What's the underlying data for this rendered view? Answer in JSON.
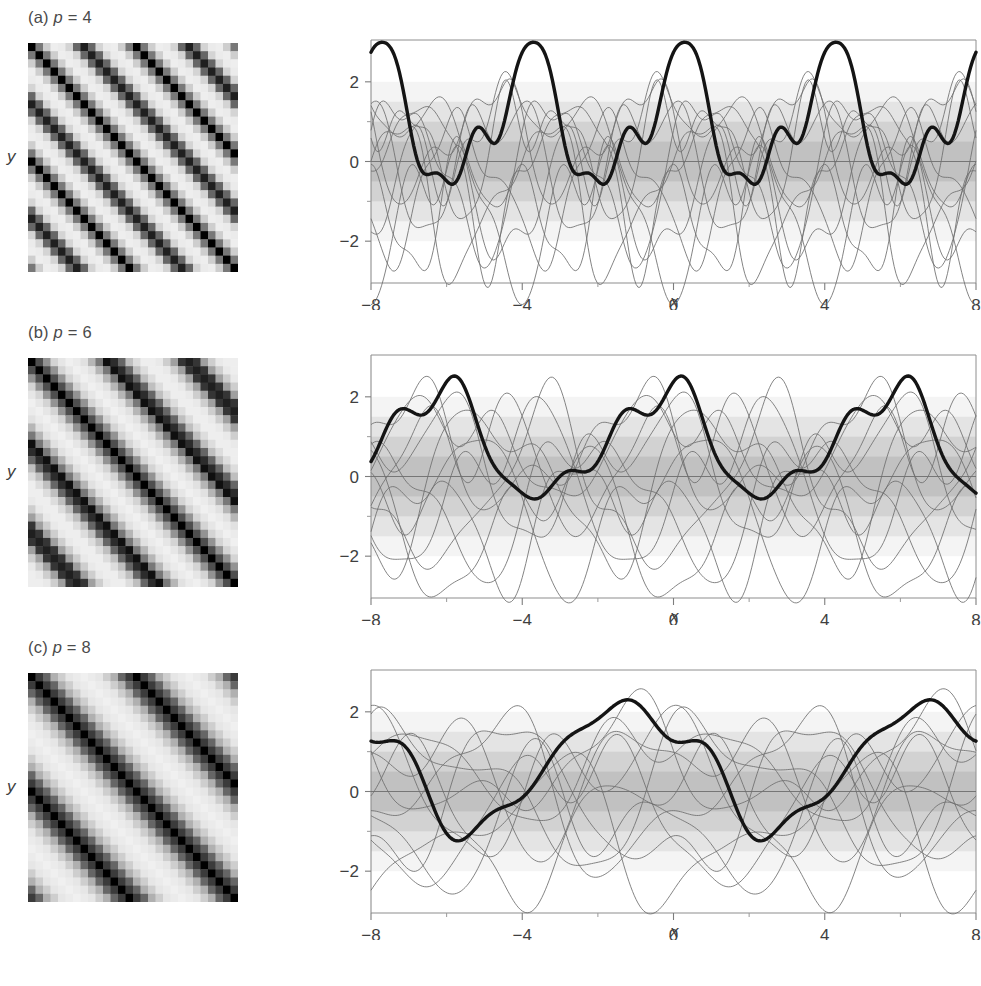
{
  "figure": {
    "background": "#ffffff",
    "ink_color": "#3f3f3f",
    "bold_curve_color": "#1a1a1a",
    "thin_curve_color": "#7a7a7a",
    "band_color": "#b9b9b9"
  },
  "panels": [
    {
      "id": "a",
      "label_prefix": "(a)",
      "label_param": "p",
      "label_eq": "=",
      "label_value": "4",
      "label_full": "(a) p = 4",
      "period": 4,
      "heatmap": {
        "type": "heatmap",
        "kernel": "periodic",
        "period": 4,
        "grid": 28,
        "x_range": [
          -8,
          8
        ],
        "y_range": [
          -8,
          8
        ],
        "lengthscale": 1.0,
        "colormap": "gray-inverted",
        "cell_px": 7.5
      },
      "chart": {
        "type": "line",
        "xlabel": "x",
        "ylabel": "y",
        "xlim": [
          -8,
          8
        ],
        "ylim": [
          -3.05,
          3.05
        ],
        "xticks": [
          -8,
          -4,
          0,
          4,
          8
        ],
        "xticklabels": [
          "−8",
          "−4",
          "0",
          "4",
          "8"
        ],
        "xminorticks": [
          -6,
          -2,
          2,
          6
        ],
        "yticks": [
          -2,
          0,
          2
        ],
        "yticklabels": [
          "−2",
          "0",
          "2"
        ],
        "yminorticks": [
          -1,
          1
        ],
        "grid": false,
        "legend": "none",
        "bands": [
          {
            "level": 0.5,
            "opacity": 0.3
          },
          {
            "level": 1.0,
            "opacity": 0.24
          },
          {
            "level": 1.5,
            "opacity": 0.18
          },
          {
            "level": 2.0,
            "opacity": 0.11
          }
        ],
        "zero_line": 0,
        "bold_series": {
          "name": "highlighted-sample",
          "period": 4,
          "amplitude": 1.55,
          "phase": 1.35,
          "harmonic_amp": 0.62,
          "harmonic_phase": 0.2,
          "offset": 0.95
        },
        "thin_series_count": 11,
        "thin_series": [
          {
            "period": 4,
            "amplitude": 1.85,
            "phase": 0.2,
            "h2": 0.55,
            "p2": 1.1,
            "offset": -0.25
          },
          {
            "period": 4,
            "amplitude": 1.4,
            "phase": 2.4,
            "h2": 0.75,
            "p2": 0.3,
            "offset": 0.1
          },
          {
            "period": 4,
            "amplitude": 1.6,
            "phase": 4.1,
            "h2": 0.45,
            "p2": 2.2,
            "offset": -0.6
          },
          {
            "period": 4,
            "amplitude": 1.1,
            "phase": 1.05,
            "h2": 0.85,
            "p2": 3.4,
            "offset": 0.35
          },
          {
            "period": 4,
            "amplitude": 1.95,
            "phase": 5.3,
            "h2": 0.3,
            "p2": 1.8,
            "offset": -0.45
          },
          {
            "period": 4,
            "amplitude": 0.95,
            "phase": 3.15,
            "h2": 0.95,
            "p2": 0.9,
            "offset": -1.05
          },
          {
            "period": 4,
            "amplitude": 1.7,
            "phase": 0.85,
            "h2": 0.65,
            "p2": 4.6,
            "offset": -0.8
          },
          {
            "period": 4,
            "amplitude": 1.25,
            "phase": 2.95,
            "h2": 0.5,
            "p2": 2.7,
            "offset": 0.55
          },
          {
            "period": 4,
            "amplitude": 1.5,
            "phase": 4.75,
            "h2": 0.7,
            "p2": 5.1,
            "offset": -1.3
          },
          {
            "period": 4,
            "amplitude": 1.05,
            "phase": 1.85,
            "h2": 0.4,
            "p2": 3.9,
            "offset": 0.7
          },
          {
            "period": 4,
            "amplitude": 1.8,
            "phase": 5.95,
            "h2": 0.6,
            "p2": 1.5,
            "offset": -0.15
          }
        ]
      }
    },
    {
      "id": "b",
      "label_prefix": "(b)",
      "label_param": "p",
      "label_eq": "=",
      "label_value": "6",
      "label_full": "(b) p = 6",
      "period": 6,
      "heatmap": {
        "type": "heatmap",
        "kernel": "periodic",
        "period": 6,
        "grid": 28,
        "x_range": [
          -8,
          8
        ],
        "y_range": [
          -8,
          8
        ],
        "lengthscale": 1.0,
        "colormap": "gray-inverted",
        "cell_px": 7.5
      },
      "chart": {
        "type": "line",
        "xlabel": "x",
        "ylabel": "y",
        "xlim": [
          -8,
          8
        ],
        "ylim": [
          -3.05,
          3.05
        ],
        "xticks": [
          -8,
          -4,
          0,
          4,
          8
        ],
        "xticklabels": [
          "−8",
          "−4",
          "0",
          "4",
          "8"
        ],
        "xminorticks": [
          -6,
          -2,
          2,
          6
        ],
        "yticks": [
          -2,
          0,
          2
        ],
        "yticklabels": [
          "−2",
          "0",
          "2"
        ],
        "yminorticks": [
          -1,
          1
        ],
        "grid": false,
        "legend": "none",
        "bands": [
          {
            "level": 0.5,
            "opacity": 0.3
          },
          {
            "level": 1.0,
            "opacity": 0.24
          },
          {
            "level": 1.5,
            "opacity": 0.18
          },
          {
            "level": 2.0,
            "opacity": 0.11
          }
        ],
        "zero_line": 0,
        "bold_series": {
          "name": "highlighted-sample",
          "period": 6,
          "amplitude": 1.3,
          "phase": 1.95,
          "harmonic_amp": 0.3,
          "harmonic_phase": 1.0,
          "offset": 0.8
        },
        "thin_series_count": 11,
        "thin_series": [
          {
            "period": 6,
            "amplitude": 1.75,
            "phase": 0.35,
            "h2": 0.7,
            "p2": 1.4,
            "offset": -0.1
          },
          {
            "period": 6,
            "amplitude": 1.3,
            "phase": 2.1,
            "h2": 0.9,
            "p2": 0.6,
            "offset": 0.25
          },
          {
            "period": 6,
            "amplitude": 1.55,
            "phase": 3.85,
            "h2": 0.55,
            "p2": 2.5,
            "offset": -0.55
          },
          {
            "period": 6,
            "amplitude": 1.05,
            "phase": 0.95,
            "h2": 1.0,
            "p2": 3.7,
            "offset": 0.4
          },
          {
            "period": 6,
            "amplitude": 1.9,
            "phase": 5.1,
            "h2": 0.4,
            "p2": 2.0,
            "offset": -0.35
          },
          {
            "period": 6,
            "amplitude": 0.9,
            "phase": 3.4,
            "h2": 1.05,
            "p2": 1.2,
            "offset": -0.95
          },
          {
            "period": 6,
            "amplitude": 1.65,
            "phase": 1.15,
            "h2": 0.75,
            "p2": 4.9,
            "offset": -0.7
          },
          {
            "period": 6,
            "amplitude": 1.2,
            "phase": 2.75,
            "h2": 0.6,
            "p2": 3.0,
            "offset": 0.6
          },
          {
            "period": 6,
            "amplitude": 1.45,
            "phase": 4.55,
            "h2": 0.8,
            "p2": 5.4,
            "offset": -1.15
          },
          {
            "period": 6,
            "amplitude": 1.0,
            "phase": 1.65,
            "h2": 0.5,
            "p2": 4.2,
            "offset": 0.75
          },
          {
            "period": 6,
            "amplitude": 1.7,
            "phase": 5.75,
            "h2": 0.7,
            "p2": 1.7,
            "offset": -0.2
          }
        ]
      }
    },
    {
      "id": "c",
      "label_prefix": "(c)",
      "label_param": "p",
      "label_eq": "=",
      "label_value": "8",
      "label_full": "(c) p = 8",
      "period": 8,
      "heatmap": {
        "type": "heatmap",
        "kernel": "periodic",
        "period": 8,
        "grid": 28,
        "x_range": [
          -8,
          8
        ],
        "y_range": [
          -8,
          8
        ],
        "lengthscale": 1.0,
        "colormap": "gray-inverted",
        "cell_px": 7.5
      },
      "chart": {
        "type": "line",
        "xlabel": "x",
        "ylabel": "y",
        "xlim": [
          -8,
          8
        ],
        "ylim": [
          -3.05,
          3.05
        ],
        "xticks": [
          -8,
          -4,
          0,
          4,
          8
        ],
        "xticklabels": [
          "−8",
          "−4",
          "0",
          "4",
          "8"
        ],
        "xminorticks": [
          -6,
          -2,
          2,
          6
        ],
        "yticks": [
          -2,
          0,
          2
        ],
        "yticklabels": [
          "−2",
          "0",
          "2"
        ],
        "yminorticks": [
          -1,
          1
        ],
        "grid": false,
        "legend": "none",
        "bands": [
          {
            "level": 0.5,
            "opacity": 0.3
          },
          {
            "level": 1.0,
            "opacity": 0.24
          },
          {
            "level": 1.5,
            "opacity": 0.18
          },
          {
            "level": 2.0,
            "opacity": 0.11
          }
        ],
        "zero_line": 0,
        "bold_series": {
          "name": "highlighted-sample",
          "period": 8,
          "amplitude": 1.52,
          "phase": 2.55,
          "harmonic_amp": 0.18,
          "harmonic_phase": 0.5,
          "offset": 0.7
        },
        "thin_series_count": 11,
        "thin_series": [
          {
            "period": 8,
            "amplitude": 1.55,
            "phase": 0.5,
            "h2": 0.8,
            "p2": 1.6,
            "offset": 0.05
          },
          {
            "period": 8,
            "amplitude": 1.2,
            "phase": 2.3,
            "h2": 1.0,
            "p2": 0.8,
            "offset": 0.3
          },
          {
            "period": 8,
            "amplitude": 1.45,
            "phase": 3.6,
            "h2": 0.65,
            "p2": 2.8,
            "offset": -0.45
          },
          {
            "period": 8,
            "amplitude": 1.0,
            "phase": 1.2,
            "h2": 1.1,
            "p2": 3.9,
            "offset": 0.45
          },
          {
            "period": 8,
            "amplitude": 1.7,
            "phase": 4.9,
            "h2": 0.5,
            "p2": 2.2,
            "offset": -0.3
          },
          {
            "period": 8,
            "amplitude": 0.85,
            "phase": 3.7,
            "h2": 1.15,
            "p2": 1.4,
            "offset": -0.85
          },
          {
            "period": 8,
            "amplitude": 1.5,
            "phase": 1.45,
            "h2": 0.85,
            "p2": 5.2,
            "offset": -0.6
          },
          {
            "period": 8,
            "amplitude": 1.1,
            "phase": 2.55,
            "h2": 0.7,
            "p2": 3.3,
            "offset": 0.55
          },
          {
            "period": 8,
            "amplitude": 1.35,
            "phase": 4.35,
            "h2": 0.9,
            "p2": 5.7,
            "offset": -1.0
          },
          {
            "period": 8,
            "amplitude": 0.95,
            "phase": 1.5,
            "h2": 0.6,
            "p2": 4.5,
            "offset": 0.65
          },
          {
            "period": 8,
            "amplitude": 1.6,
            "phase": 5.55,
            "h2": 0.8,
            "p2": 1.9,
            "offset": -0.1
          }
        ]
      }
    }
  ],
  "chart_data": {
    "type": "line",
    "subplots": 3,
    "shared_xlabel": "x",
    "shared_ylabel": "y",
    "xlim": [
      -8,
      8
    ],
    "ylim": [
      -3.05,
      3.05
    ],
    "xticks": [
      -8,
      -4,
      0,
      4,
      8
    ],
    "xticklabels": [
      "−8",
      "−4",
      "0",
      "4",
      "8"
    ],
    "yticks": [
      -2,
      0,
      2
    ],
    "yticklabels": [
      "−2",
      "0",
      "2"
    ],
    "grid": false,
    "legend": "none",
    "series_per_panel": 12,
    "bold_series_per_panel": 1,
    "panel_periods": [
      4,
      6,
      8
    ],
    "panel_labels": [
      "(a) p = 4",
      "(b) p = 6",
      "(c) p = 8"
    ],
    "companion_heatmaps": {
      "type": "heatmap",
      "count": 3,
      "kernel": "periodic covariance matrix",
      "colormap": "gray-inverted",
      "periods": [
        4,
        6,
        8
      ]
    }
  }
}
